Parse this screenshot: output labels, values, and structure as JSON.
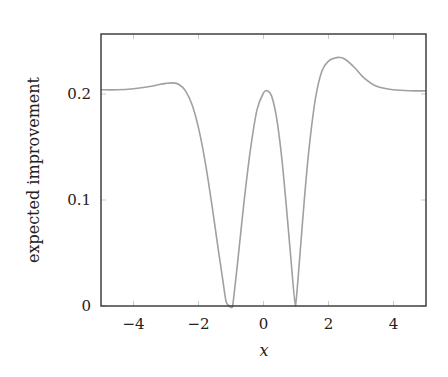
{
  "chart_data": {
    "type": "line",
    "title": "",
    "xlabel": "x",
    "ylabel": "expected improvement",
    "xlim": [
      -5,
      5
    ],
    "ylim": [
      0,
      0.24
    ],
    "grid": false,
    "legend": null,
    "x_ticks": [
      -4,
      -2,
      0,
      2,
      4
    ],
    "x_tick_labels": [
      "−4",
      "−2",
      "0",
      "2",
      "4"
    ],
    "y_ticks": [
      0,
      0.1,
      0.2
    ],
    "y_tick_labels": [
      "0",
      "0.1",
      "0.2"
    ],
    "series": [
      {
        "name": "expected improvement",
        "color": "#a0a0a0",
        "x": [
          -5.0,
          -4.5,
          -4.0,
          -3.5,
          -3.2,
          -3.0,
          -2.8,
          -2.6,
          -2.4,
          -2.2,
          -2.0,
          -1.8,
          -1.6,
          -1.4,
          -1.25,
          -1.15,
          -1.05,
          -0.95,
          -0.8,
          -0.6,
          -0.4,
          -0.2,
          0.0,
          0.12,
          0.25,
          0.4,
          0.55,
          0.7,
          0.85,
          0.98,
          1.1,
          1.25,
          1.4,
          1.6,
          1.8,
          2.0,
          2.2,
          2.35,
          2.5,
          2.8,
          3.1,
          3.5,
          4.0,
          4.5,
          5.0
        ],
        "y": [
          0.204,
          0.204,
          0.205,
          0.207,
          0.209,
          0.21,
          0.2105,
          0.209,
          0.203,
          0.19,
          0.168,
          0.137,
          0.098,
          0.055,
          0.024,
          0.004,
          0.0,
          0.0,
          0.04,
          0.098,
          0.148,
          0.185,
          0.201,
          0.203,
          0.198,
          0.178,
          0.143,
          0.095,
          0.042,
          0.0,
          0.04,
          0.098,
          0.148,
          0.196,
          0.222,
          0.231,
          0.234,
          0.2345,
          0.233,
          0.225,
          0.215,
          0.207,
          0.204,
          0.203,
          0.203
        ]
      }
    ]
  }
}
